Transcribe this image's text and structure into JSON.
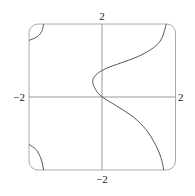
{
  "chart_data": {
    "type": "line",
    "title": "",
    "xlabel": "",
    "ylabel": "",
    "xlim": [
      -2,
      2
    ],
    "ylim": [
      -2,
      2
    ],
    "grid": false,
    "tick_labels": {
      "x_left": "−2",
      "x_right": "2",
      "y_top": "2",
      "y_bottom": "−2"
    },
    "series": [
      {
        "name": "main-branch",
        "points": [
          [
            1.75,
            2
          ],
          [
            1.62,
            1.6
          ],
          [
            1.4,
            1.35
          ],
          [
            1.0,
            1.12
          ],
          [
            0.5,
            0.93
          ],
          [
            0.1,
            0.78
          ],
          [
            -0.18,
            0.6
          ],
          [
            -0.26,
            0.42
          ],
          [
            -0.18,
            0.2
          ],
          [
            0,
            0
          ],
          [
            0.4,
            -0.25
          ],
          [
            0.85,
            -0.55
          ],
          [
            1.2,
            -0.9
          ],
          [
            1.45,
            -1.3
          ],
          [
            1.6,
            -1.65
          ],
          [
            1.68,
            -2
          ]
        ]
      },
      {
        "name": "top-left-branch",
        "points": [
          [
            -1.6,
            2
          ],
          [
            -1.65,
            1.8
          ],
          [
            -1.78,
            1.65
          ],
          [
            -2,
            1.55
          ]
        ]
      },
      {
        "name": "bottom-left-branch",
        "points": [
          [
            -2,
            -1.3
          ],
          [
            -1.8,
            -1.45
          ],
          [
            -1.67,
            -1.7
          ],
          [
            -1.6,
            -2
          ]
        ]
      }
    ]
  }
}
